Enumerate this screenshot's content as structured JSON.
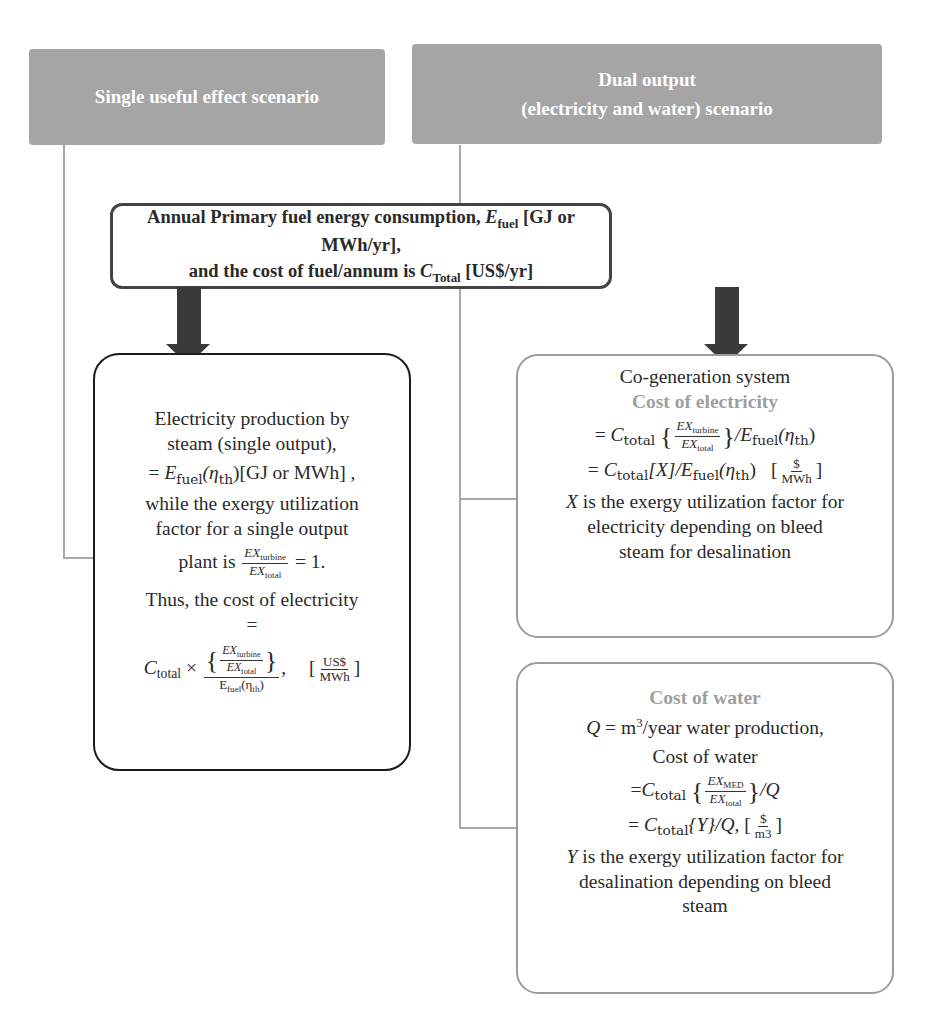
{
  "headers": {
    "left": "Single useful effect scenario",
    "right_line1": "Dual output",
    "right_line2": "(electricity and water) scenario"
  },
  "top_box": {
    "line1_pre": "Annual Primary fuel energy consumption, ",
    "line1_sym": "E",
    "line1_sub": "fuel",
    "line1_post": " [GJ or MWh/yr],",
    "line2_pre": "and the cost of fuel/annum is ",
    "line2_sym": "C",
    "line2_sub": "Total",
    "line2_post": " [US$/yr]"
  },
  "left_box": {
    "line1": "Electricity production by",
    "line2": "steam (single output),",
    "eq1_pre": "= ",
    "eq1_E": "E",
    "eq1_E_sub": "fuel",
    "eq1_eta": "(η",
    "eq1_eta_sub": "th",
    "eq1_post": ")[GJ or MWh] ,",
    "line3": "while the exergy utilization",
    "line4": "factor for a single output",
    "line5_pre": "plant is ",
    "frac_num": "EX",
    "frac_num_sub": "turbine",
    "frac_den": "EX",
    "frac_den_sub": "total",
    "line5_post": " = 1.",
    "line6": "Thus, the cost of electricity",
    "line7": "=",
    "c_sym": "C",
    "c_sub": "total",
    "times": " × ",
    "big_num_num": "EX",
    "big_num_num_sub": "turbine",
    "big_num_den": "EX",
    "big_num_den_sub": "total",
    "big_den": "E",
    "big_den_sub": "fuel",
    "big_den_eta": "(η",
    "big_den_eta_sub": "th",
    "big_den_close": ")",
    "comma": ",",
    "unit_num": "US$",
    "unit_den": "MWh"
  },
  "cogen_box": {
    "title": "Co-generation system",
    "subtitle": "Cost of electricity",
    "eq1_pre": "= ",
    "c_sym": "C",
    "c_sub": "total",
    "frac_num": "EX",
    "frac_num_sub": "turbine",
    "frac_den": "EX",
    "frac_den_sub": "total",
    "eq1_post": "/E",
    "eq1_E_sub": "fuel",
    "eq1_eta": "(η",
    "eq1_eta_sub": "th",
    "eq1_close": ")",
    "eq2_pre": "= ",
    "eq2_mid": "[X]/E",
    "eq2_E_sub": "fuel",
    "eq2_eta": "(η",
    "eq2_eta_sub": "th",
    "eq2_close": ")",
    "unit_num": "$",
    "unit_den": "MWh",
    "desc_sym": "X",
    "desc_line1": " is the exergy utilization factor for",
    "desc_line2": "electricity depending on bleed",
    "desc_line3": "steam for desalination"
  },
  "water_box": {
    "title": "Cost of water",
    "q_sym": "Q",
    "q_pre": " = m",
    "q_sup": "3",
    "q_post": "/year water production,",
    "line2": "Cost of water",
    "eq1_pre": "=",
    "c_sym": "C",
    "c_sub": "total",
    "frac_num": "EX",
    "frac_num_sub": "MED",
    "frac_den": "EX",
    "frac_den_sub": "total",
    "eq1_post": "/Q",
    "eq2_pre": "= ",
    "eq2_mid": "{Y}/Q, ",
    "unit_num": "$",
    "unit_den": "m3",
    "desc_sym": "Y",
    "desc_line1": " is the exergy utilization factor for",
    "desc_line2": "desalination depending on bleed",
    "desc_line3": "steam"
  },
  "colors": {
    "header_bg": "#a5a5a5",
    "connector": "#a8a8a8",
    "arrow": "#3a3a3a",
    "top_box_border": "#444444",
    "left_box_border": "#1c1c1c",
    "right_box_border": "#9c9c9c",
    "subtitle_text": "#9e9e9e"
  }
}
